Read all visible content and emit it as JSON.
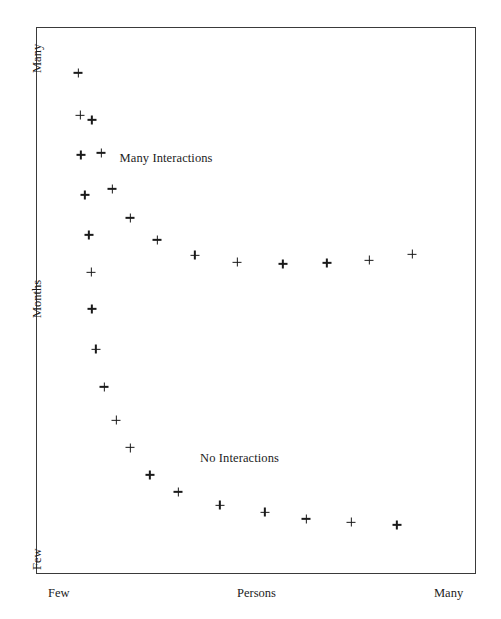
{
  "chart_data": {
    "type": "scatter",
    "title": "",
    "xlabel": "Persons",
    "ylabel": "Months",
    "xlim": [
      0,
      100
    ],
    "ylim": [
      0,
      100
    ],
    "grid": false,
    "legend": "none",
    "x_ticks": [
      {
        "label": "Few",
        "value": 0
      },
      {
        "label": "Persons",
        "value": 47
      },
      {
        "label": "Many",
        "value": 95
      }
    ],
    "y_ticks": [
      {
        "label": "Many",
        "value": 96
      },
      {
        "label": "Months",
        "value": 48
      },
      {
        "label": "Few",
        "value": 2
      }
    ],
    "annotations": [
      {
        "text": "Many Interactions",
        "x": 19.0,
        "y": 75.8
      },
      {
        "text": "No Interactions",
        "x": 37.3,
        "y": 21.0
      }
    ],
    "marker": "plus",
    "marker_color": "#1a1a1a",
    "series": [
      {
        "name": "Many Interactions",
        "points": [
          {
            "x": 9.6,
            "y": 91.6
          },
          {
            "x": 10.0,
            "y": 83.9
          },
          {
            "x": 12.7,
            "y": 83.0
          },
          {
            "x": 10.2,
            "y": 76.6
          },
          {
            "x": 14.8,
            "y": 77.0
          },
          {
            "x": 11.1,
            "y": 69.3
          },
          {
            "x": 17.3,
            "y": 70.4
          },
          {
            "x": 21.4,
            "y": 65.1
          },
          {
            "x": 12.0,
            "y": 62.0
          },
          {
            "x": 27.5,
            "y": 61.1
          },
          {
            "x": 36.1,
            "y": 58.3
          },
          {
            "x": 45.7,
            "y": 57.0
          },
          {
            "x": 56.1,
            "y": 56.7
          },
          {
            "x": 66.1,
            "y": 56.9
          },
          {
            "x": 75.7,
            "y": 57.4
          },
          {
            "x": 85.5,
            "y": 58.5
          }
        ]
      },
      {
        "name": "No Interactions",
        "points": [
          {
            "x": 12.5,
            "y": 55.2
          },
          {
            "x": 12.7,
            "y": 48.5
          },
          {
            "x": 13.6,
            "y": 41.1
          },
          {
            "x": 15.5,
            "y": 34.2
          },
          {
            "x": 18.2,
            "y": 28.1
          },
          {
            "x": 21.4,
            "y": 23.1
          },
          {
            "x": 25.9,
            "y": 18.1
          },
          {
            "x": 32.3,
            "y": 15.0
          },
          {
            "x": 41.8,
            "y": 12.6
          },
          {
            "x": 52.0,
            "y": 11.3
          },
          {
            "x": 61.4,
            "y": 10.1
          },
          {
            "x": 71.6,
            "y": 9.5
          },
          {
            "x": 82.0,
            "y": 9.0
          }
        ]
      }
    ]
  },
  "frame": {
    "border_color": "#3a3a3a",
    "background": "#ffffff"
  }
}
